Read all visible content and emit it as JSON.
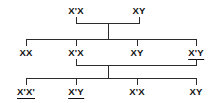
{
  "diagram": {
    "line_color": "#2b2b2b",
    "text_color": "#111111",
    "generations": [
      {
        "id": "generation-1",
        "individuals": [
          {
            "id": "g1-p1",
            "label": "X'X",
            "base": "X",
            "prime_first": true,
            "underlined": false,
            "x": 76,
            "y": 5
          },
          {
            "id": "g1-p2",
            "label": "XY",
            "base": "XY",
            "prime_first": false,
            "underlined": false,
            "x": 139,
            "y": 5
          }
        ]
      },
      {
        "id": "generation-2",
        "individuals": [
          {
            "id": "g2-c1",
            "label": "XX",
            "underlined": false,
            "x": 26,
            "y": 47
          },
          {
            "id": "g2-c2",
            "label": "X'X",
            "underlined": false,
            "x": 76,
            "y": 47
          },
          {
            "id": "g2-c3",
            "label": "XY",
            "underlined": false,
            "x": 137,
            "y": 47
          },
          {
            "id": "g2-c4",
            "label": "X'Y",
            "underlined": true,
            "x": 196,
            "y": 47
          }
        ]
      },
      {
        "id": "generation-3",
        "individuals": [
          {
            "id": "g3-c1",
            "label": "X'X'",
            "underlined": true,
            "x": 26,
            "y": 86
          },
          {
            "id": "g3-c2",
            "label": "X'Y",
            "underlined": true,
            "x": 76,
            "y": 86
          },
          {
            "id": "g3-c3",
            "label": "X'X",
            "underlined": false,
            "x": 137,
            "y": 86
          },
          {
            "id": "g3-c4",
            "label": "XY",
            "underlined": false,
            "x": 196,
            "y": 86
          }
        ]
      }
    ],
    "labels": {
      "g1_mother": "X'X",
      "g1_father": "XY",
      "g2_child_1": "XX",
      "g2_child_2": "X'X",
      "g2_child_3": "XY",
      "g2_child_4": "X'Y",
      "g3_child_1": "X'X'",
      "g3_child_2": "X'Y",
      "g3_child_3": "X'X",
      "g3_child_4": "XY"
    }
  }
}
